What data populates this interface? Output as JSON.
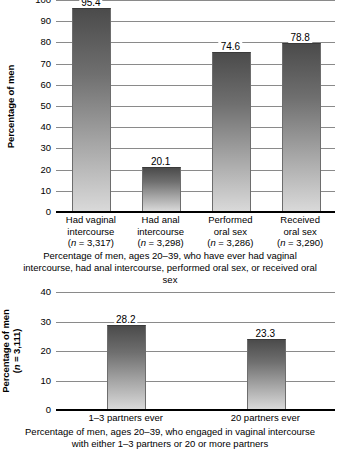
{
  "chart_data": [
    {
      "id": "chart-sexual-behaviors",
      "type": "bar",
      "title": "",
      "caption": "Percentage of men, ages 20–39, who have ever had vaginal intercourse, had anal intercourse, performed oral sex, or received oral sex",
      "ylabel": "Percentage of men",
      "xlabel": "",
      "ylim": [
        0,
        100
      ],
      "yticks": [
        0,
        10,
        20,
        30,
        40,
        50,
        60,
        70,
        80,
        90,
        100
      ],
      "grid": true,
      "legend": "none",
      "categories": [
        "Had vaginal intercourse",
        "Had anal intercourse",
        "Performed oral sex",
        "Received oral sex"
      ],
      "category_lines": [
        [
          "Had vaginal",
          "intercourse"
        ],
        [
          "Had anal",
          "intercourse"
        ],
        [
          "Performed",
          "oral sex"
        ],
        [
          "Received",
          "oral sex"
        ]
      ],
      "category_n": [
        "(n = 3,317)",
        "(n = 3,298)",
        "(n = 3,286)",
        "(n = 3,290)"
      ],
      "values": [
        95.4,
        20.1,
        74.6,
        78.8
      ],
      "value_labels": [
        "95.4",
        "20.1",
        "74.6",
        "78.8"
      ]
    },
    {
      "id": "chart-partner-counts",
      "type": "bar",
      "title": "",
      "caption": "Percentage of men, ages 20–39, who engaged in vaginal intercourse with either 1–3 partners or 20 or more partners",
      "ylabel": "Percentage of men",
      "ylabel_sub": "(n = 3,111)",
      "xlabel": "",
      "ylim": [
        0,
        40
      ],
      "yticks": [
        0,
        10,
        20,
        30,
        40
      ],
      "grid": true,
      "legend": "none",
      "categories": [
        "1–3 partners ever",
        "20 partners ever"
      ],
      "values": [
        28.2,
        23.3
      ],
      "value_labels": [
        "28.2",
        "23.3"
      ]
    }
  ],
  "style": {
    "background": "#ffffff",
    "text_color": "#000000",
    "gridline_color": "#8a8a8a",
    "axis_color": "#000000",
    "bar_gradient_top": "#4b4b4b",
    "bar_gradient_bottom": "#d9d9d9"
  }
}
